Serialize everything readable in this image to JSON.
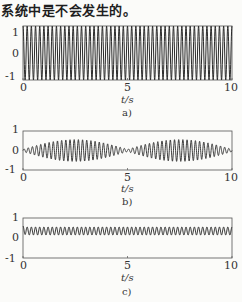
{
  "header": {
    "text": "系统中是不会发生的。"
  },
  "chart_data": [
    {
      "type": "line",
      "caption": "a)",
      "xlabel": "t/s",
      "ylabel": "",
      "xlim": [
        0,
        10
      ],
      "ylim": [
        -1,
        1
      ],
      "xticks": [
        "0",
        "5",
        "10"
      ],
      "yticks": [
        "1",
        "0",
        "-1"
      ],
      "grid": false,
      "description": "Constant-amplitude oscillation, amplitude 1, ~5 cycles per second",
      "series": [
        {
          "name": "y(t)",
          "kind": "sine",
          "amplitude": 1.0,
          "offset": 0.0,
          "frequency_hz": 5.0
        }
      ]
    },
    {
      "type": "line",
      "caption": "b)",
      "xlabel": "t/s",
      "ylabel": "",
      "xlim": [
        0,
        10
      ],
      "ylim": [
        -1,
        1
      ],
      "xticks": [
        "0",
        "5",
        "10"
      ],
      "yticks": [
        "1",
        "0",
        "-1"
      ],
      "grid": false,
      "description": "Beating oscillation; envelope ~0 at t=0,5,10 and peak ~0.5 at t=2.5,7.5",
      "series": [
        {
          "name": "y(t)",
          "kind": "beat",
          "amplitude": 0.5,
          "offset": 0.0,
          "frequency_hz": 5.0,
          "envelope_period_s": 5.0
        }
      ]
    },
    {
      "type": "line",
      "caption": "c)",
      "xlabel": "t/s",
      "ylabel": "",
      "xlim": [
        0,
        10
      ],
      "ylim": [
        -1,
        1
      ],
      "xticks": [
        "0",
        "5",
        "10"
      ],
      "yticks": [
        "1",
        "0",
        "-1"
      ],
      "grid": false,
      "description": "Small oscillation around offset ~0.35 with amplitude ~0.2, starting near 0.6",
      "series": [
        {
          "name": "y(t)",
          "kind": "sine",
          "amplitude": 0.2,
          "offset": 0.35,
          "frequency_hz": 5.0,
          "initial_value": 0.6
        }
      ]
    }
  ],
  "style": {
    "line_color": "#2a2a2a",
    "axis_color": "#555555",
    "background": "#fbfbf9"
  }
}
